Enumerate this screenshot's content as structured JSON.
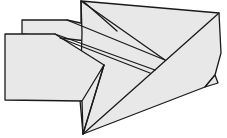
{
  "diagram": {
    "colors": {
      "fill": "#e8e8e8",
      "stroke": "#1a1a1a",
      "background": "#ffffff"
    },
    "faces": [
      {
        "name": "back-rear-flap",
        "points": "22,20 67,20 117,31 113,44 60,38 22,34"
      },
      {
        "name": "main-top-wing",
        "points": "81,1 219,13 221,53 215,75 205,87 83,134 80,100 82,33"
      },
      {
        "name": "front-flap",
        "points": "5,34 55,34 104,65 88,101 82,101 5,100"
      },
      {
        "name": "lower-triangle",
        "points": "82,101 104,65 83,134"
      },
      {
        "name": "right-small-flap",
        "points": "215,75 218,83 205,87"
      }
    ],
    "lines": [
      {
        "name": "apex-diagonal-1",
        "x1": 81,
        "y1": 1,
        "x2": 165,
        "y2": 60
      },
      {
        "name": "apex-diagonal-2",
        "x1": 84,
        "y1": 2,
        "x2": 117,
        "y2": 31
      },
      {
        "name": "top-right-to-bottom",
        "x1": 219,
        "y1": 13,
        "x2": 83,
        "y2": 134
      },
      {
        "name": "crease-1",
        "x1": 67,
        "y1": 20,
        "x2": 165,
        "y2": 60
      },
      {
        "name": "crease-2",
        "x1": 55,
        "y1": 34,
        "x2": 155,
        "y2": 70
      },
      {
        "name": "crease-3",
        "x1": 60,
        "y1": 38,
        "x2": 150,
        "y2": 73
      },
      {
        "name": "left-vertical",
        "x1": 81,
        "y1": 1,
        "x2": 81,
        "y2": 22
      },
      {
        "name": "bottom-inner",
        "x1": 104,
        "y1": 65,
        "x2": 83,
        "y2": 134
      }
    ]
  }
}
